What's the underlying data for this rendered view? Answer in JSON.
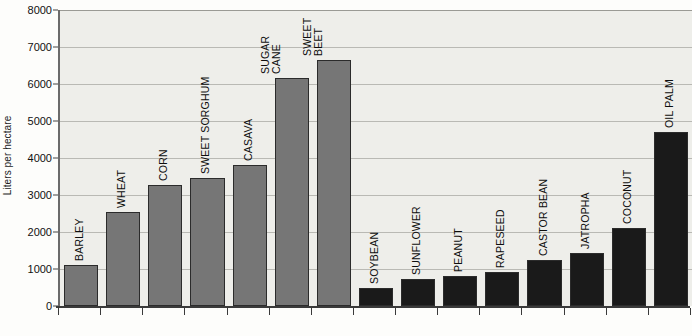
{
  "chart_data": {
    "type": "bar",
    "title": "",
    "xlabel": "",
    "ylabel": "Liters per hectare",
    "ylim": [
      0,
      8000
    ],
    "ytick_labels": [
      "8000",
      "7000",
      "6000",
      "5000",
      "4000",
      "3000",
      "2000",
      "1000",
      "0"
    ],
    "ytick_values": [
      8000,
      7000,
      6000,
      5000,
      4000,
      3000,
      2000,
      1000,
      0
    ],
    "grid": true,
    "legend": "none",
    "categories": [
      "BARLEY",
      "WHEAT",
      "CORN",
      "SWEET SORGHUM",
      "CASAVA",
      "SUGAR CANE",
      "SWEET BEET",
      "SOYBEAN",
      "SUNFLOWER",
      "PEANUT",
      "RAPESEED",
      "CASTOR BEAN",
      "JATROPHA",
      "COCONUT",
      "OIL PALM"
    ],
    "values": [
      1100,
      2550,
      3280,
      3450,
      3800,
      6150,
      6650,
      480,
      720,
      800,
      930,
      1250,
      1440,
      2120,
      4700
    ],
    "bar_colors": [
      "#767676",
      "#767676",
      "#767676",
      "#767676",
      "#767676",
      "#767676",
      "#767676",
      "#1a1a1a",
      "#1a1a1a",
      "#1a1a1a",
      "#1a1a1a",
      "#1a1a1a",
      "#1a1a1a",
      "#1a1a1a",
      "#1a1a1a"
    ],
    "label_lines": [
      [
        "BARLEY"
      ],
      [
        "WHEAT"
      ],
      [
        "CORN"
      ],
      [
        "SWEET SORGHUM"
      ],
      [
        "CASAVA"
      ],
      [
        "SUGAR",
        "CANE"
      ],
      [
        "SWEET",
        "BEET"
      ],
      [
        "SOYBEAN"
      ],
      [
        "SUNFLOWER"
      ],
      [
        "PEANUT"
      ],
      [
        "RAPESEED"
      ],
      [
        "CASTOR BEAN"
      ],
      [
        "JATROPHA"
      ],
      [
        "COCONUT"
      ],
      [
        "OIL PALM"
      ]
    ],
    "colors": {
      "plot_background": "#eeeeea",
      "gridline": "#b9b9b4",
      "axis": "#3a3a3a",
      "ethanol_bar": "#767676",
      "biodiesel_bar": "#1a1a1a",
      "text": "#111111"
    }
  }
}
